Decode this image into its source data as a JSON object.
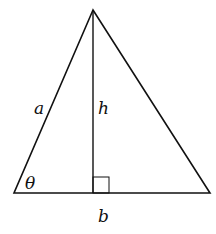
{
  "diagram": {
    "type": "triangle-with-altitude",
    "stroke_color": "#111111",
    "background": "#ffffff",
    "vertices": {
      "apex": [
        93,
        10
      ],
      "left": [
        14,
        193
      ],
      "right": [
        210,
        193
      ]
    },
    "altitude_foot": [
      93,
      193
    ],
    "right_angle_box": {
      "x": 93,
      "y": 177,
      "size": 16
    },
    "labels": {
      "side_a": "a",
      "height_h": "h",
      "base_b": "b",
      "angle_theta": "θ"
    }
  }
}
